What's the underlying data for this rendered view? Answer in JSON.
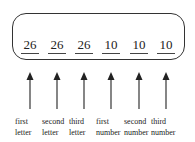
{
  "diagram": {
    "slots": [
      {
        "value": "26",
        "label_line1": "first",
        "label_line2": "letter",
        "x": 30
      },
      {
        "value": "26",
        "label_line1": "second",
        "label_line2": "letter",
        "x": 57
      },
      {
        "value": "26",
        "label_line1": "third",
        "label_line2": "letter",
        "x": 84
      },
      {
        "value": "10",
        "label_line1": "first",
        "label_line2": "number",
        "x": 111
      },
      {
        "value": "10",
        "label_line1": "second",
        "label_line2": "number",
        "x": 139
      },
      {
        "value": "10",
        "label_line1": "third",
        "label_line2": "number",
        "x": 166
      }
    ],
    "colors": {
      "stroke": "#333333",
      "text": "#222222",
      "background": "#ffffff"
    }
  }
}
